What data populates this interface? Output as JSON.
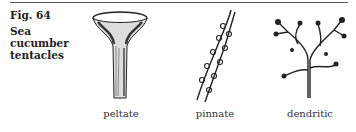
{
  "figure": {
    "number_label": "Fig. 64",
    "caption_line1": "Sea cucumber",
    "caption_line2": "tentacles"
  },
  "tentacle_types": [
    {
      "label": "peltate",
      "icon": "peltate-tentacle-illustration"
    },
    {
      "label": "pinnate",
      "icon": "pinnate-tentacle-illustration"
    },
    {
      "label": "dendritic",
      "icon": "dendritic-tentacle-illustration"
    }
  ]
}
